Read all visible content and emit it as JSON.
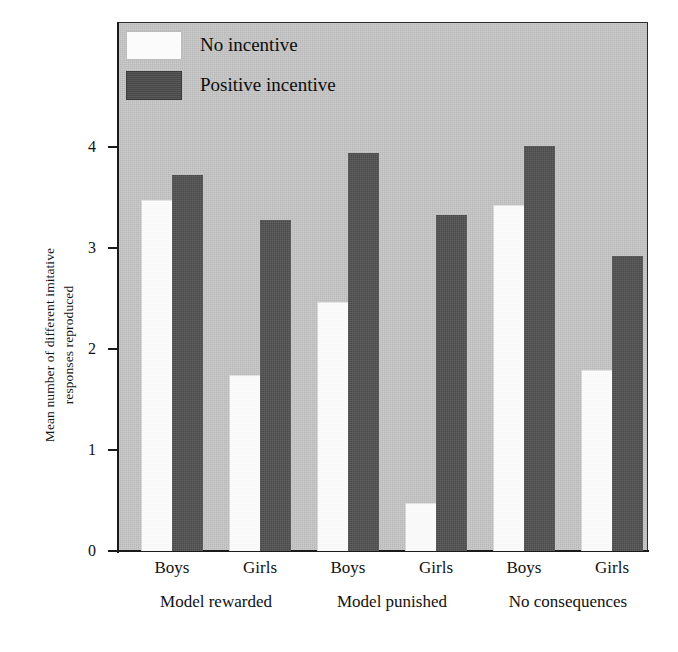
{
  "chart_data": {
    "type": "bar",
    "title": "",
    "subtitle": "",
    "xlabel": "",
    "ylabel_lines": [
      "Mean number of different imitative",
      "responses reproduced"
    ],
    "ylabel": "Mean number of different imitative responses reproduced",
    "ylim": [
      0,
      4.7
    ],
    "yticks": [
      0,
      1,
      2,
      3,
      4
    ],
    "ytick_labels": [
      "0",
      "1",
      "2",
      "3",
      "4"
    ],
    "grid": false,
    "legend_position": "top-left",
    "categories": [
      "Boys",
      "Girls",
      "Boys",
      "Girls",
      "Boys",
      "Girls"
    ],
    "groups": [
      {
        "label": "Model rewarded",
        "categories": [
          "Boys",
          "Girls"
        ],
        "values": {
          "No incentive": [
            3.47,
            1.74
          ],
          "Positive incentive": [
            3.71,
            3.27
          ]
        }
      },
      {
        "label": "Model punished",
        "categories": [
          "Boys",
          "Girls"
        ],
        "values": {
          "No incentive": [
            2.46,
            0.47
          ],
          "Positive incentive": [
            3.93,
            3.32
          ]
        }
      },
      {
        "label": "No consequences",
        "categories": [
          "Boys",
          "Girls"
        ],
        "values": {
          "No incentive": [
            3.42,
            1.79
          ],
          "Positive incentive": [
            4.0,
            2.91
          ]
        }
      }
    ],
    "series": [
      {
        "name": "No incentive",
        "color": "#fbfbfb",
        "values": [
          3.47,
          1.74,
          2.46,
          0.47,
          3.42,
          1.79
        ]
      },
      {
        "name": "Positive incentive",
        "color": "#525252",
        "values": [
          3.71,
          3.27,
          3.93,
          3.32,
          4.0,
          2.91
        ]
      }
    ],
    "bars": [
      {
        "group": "Model rewarded",
        "category": "Boys",
        "series": "No incentive",
        "value": 3.47
      },
      {
        "group": "Model rewarded",
        "category": "Boys",
        "series": "Positive incentive",
        "value": 3.71
      },
      {
        "group": "Model rewarded",
        "category": "Girls",
        "series": "No incentive",
        "value": 1.74
      },
      {
        "group": "Model rewarded",
        "category": "Girls",
        "series": "Positive incentive",
        "value": 3.27
      },
      {
        "group": "Model punished",
        "category": "Boys",
        "series": "No incentive",
        "value": 2.46
      },
      {
        "group": "Model punished",
        "category": "Boys",
        "series": "Positive incentive",
        "value": 3.93
      },
      {
        "group": "Model punished",
        "category": "Girls",
        "series": "No incentive",
        "value": 0.47
      },
      {
        "group": "Model punished",
        "category": "Girls",
        "series": "Positive incentive",
        "value": 3.32
      },
      {
        "group": "No consequences",
        "category": "Boys",
        "series": "No incentive",
        "value": 3.42
      },
      {
        "group": "No consequences",
        "category": "Boys",
        "series": "Positive incentive",
        "value": 4.0
      },
      {
        "group": "No consequences",
        "category": "Girls",
        "series": "No incentive",
        "value": 1.79
      },
      {
        "group": "No consequences",
        "category": "Girls",
        "series": "Positive incentive",
        "value": 2.91
      }
    ],
    "legend": [
      {
        "label": "No incentive",
        "swatch": "light"
      },
      {
        "label": "Positive incentive",
        "swatch": "dark"
      }
    ],
    "colors": {
      "plot_background": "#c6c6c6",
      "figure_background": "#ffffff",
      "axis": "#1a1a1a",
      "light_bar": "#fbfbfb",
      "dark_bar": "#525252",
      "text": "#111111"
    }
  }
}
